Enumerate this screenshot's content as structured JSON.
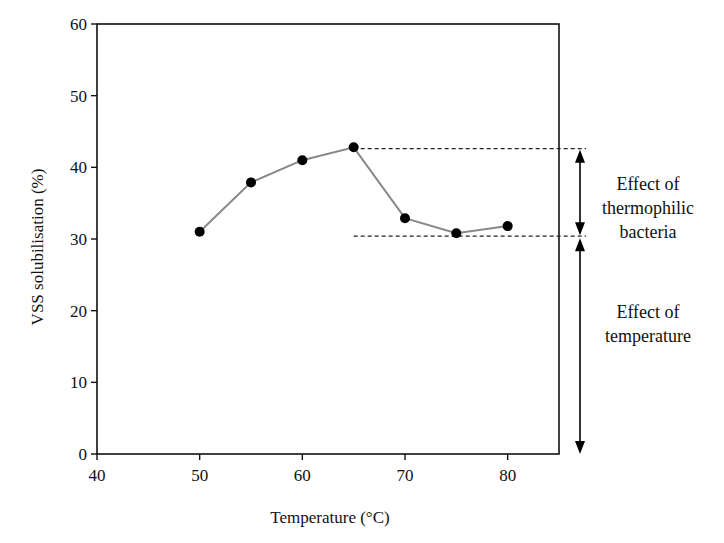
{
  "chart_data": {
    "type": "line",
    "title": "",
    "xlabel": "Temperature (°C)",
    "ylabel": "VSS solubilisation (%)",
    "xlim": [
      40,
      85
    ],
    "ylim": [
      0,
      60
    ],
    "xticks": [
      40,
      50,
      60,
      70,
      80
    ],
    "yticks": [
      0,
      10,
      20,
      30,
      40,
      50,
      60
    ],
    "grid": false,
    "legend": null,
    "series": [
      {
        "name": "VSS solubilisation",
        "x": [
          50,
          55,
          60,
          65,
          70,
          75,
          80
        ],
        "values": [
          31.0,
          37.9,
          41.0,
          42.8,
          32.9,
          30.8,
          31.8
        ],
        "marker": "filled-circle",
        "line_color": "#888888",
        "marker_color": "#000000"
      }
    ],
    "reference_lines": [
      {
        "style": "dashed",
        "y": 42.6,
        "x_start": 65,
        "label": "maximum solubilisation"
      },
      {
        "style": "dashed",
        "y": 30.4,
        "x_start": 65,
        "label": "thermophilic baseline"
      }
    ],
    "annotations": [
      {
        "type": "double-arrow",
        "from_y": 42.6,
        "to_y": 30.4,
        "text": "Effect of thermophilic bacteria"
      },
      {
        "type": "double-arrow",
        "from_y": 30.4,
        "to_y": 0,
        "text": "Effect of temperature"
      }
    ]
  },
  "labels": {
    "xlabel": "Temperature (°C)",
    "ylabel": "VSS solubilisation (%)",
    "annot1": [
      "Effect of",
      "thermophilic",
      "bacteria"
    ],
    "annot2": [
      "Effect of",
      "temperature"
    ]
  },
  "colors": {
    "axis": "#111111",
    "line": "#8a8a8a",
    "marker": "#000000",
    "dashed": "#222222"
  }
}
